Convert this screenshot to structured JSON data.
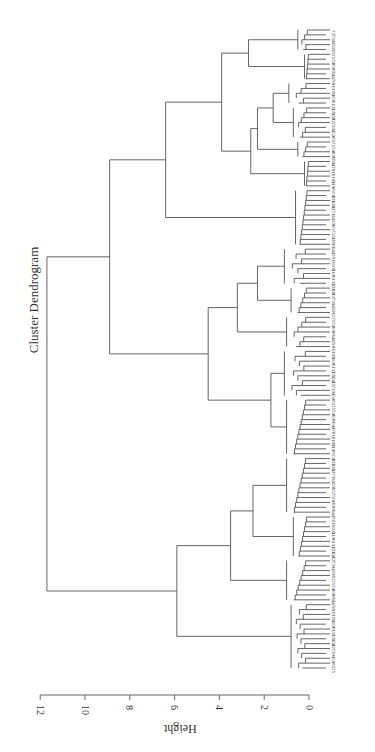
{
  "chart_data": {
    "type": "dendrogram",
    "title": "Cluster Dendrogram",
    "xlabel": "",
    "ylabel": "Height",
    "orientation": "rotated-90 (height axis horizontal, leaves on right)",
    "ylim": [
      0,
      12
    ],
    "ticks": [
      0,
      2,
      4,
      6,
      8,
      10,
      12
    ],
    "line_color": "#555555",
    "tree": {
      "h": 11.7,
      "children": [
        {
          "h": 8.9,
          "children": [
            {
              "h": 6.4,
              "children": [
                {
                  "h": 3.9,
                  "children": [
                    {
                      "h": 2.7,
                      "children": [
                        {
                          "h": 0.5,
                          "leaves": 5
                        },
                        {
                          "h": 0.2,
                          "leaves": 6
                        }
                      ]
                    },
                    {
                      "h": 2.6,
                      "children": [
                        {
                          "h": 2.3,
                          "children": [
                            {
                              "h": 1.6,
                              "children": [
                                {
                                  "h": 0.9,
                                  "leaves": 5
                                },
                                {
                                  "h": 0.7,
                                  "leaves": 7
                                }
                              ]
                            },
                            {
                              "h": 0.5,
                              "leaves": 4
                            }
                          ]
                        },
                        {
                          "h": 0.2,
                          "leaves": 6
                        }
                      ]
                    }
                  ]
                },
                {
                  "h": 0.6,
                  "leaves": 12
                }
              ]
            },
            {
              "h": 4.5,
              "children": [
                {
                  "h": 3.2,
                  "children": [
                    {
                      "h": 2.3,
                      "children": [
                        {
                          "h": 1.1,
                          "leaves": 8
                        },
                        {
                          "h": 0.8,
                          "leaves": 6
                        }
                      ]
                    },
                    {
                      "h": 1.0,
                      "leaves": 7
                    }
                  ]
                },
                {
                  "h": 1.7,
                  "children": [
                    {
                      "h": 1.1,
                      "leaves": 10
                    },
                    {
                      "h": 1.0,
                      "leaves": 12
                    }
                  ]
                }
              ]
            }
          ]
        },
        {
          "h": 5.9,
          "children": [
            {
              "h": 3.5,
              "children": [
                {
                  "h": 2.5,
                  "children": [
                    {
                      "h": 1.0,
                      "leaves": 12
                    },
                    {
                      "h": 0.7,
                      "leaves": 9
                    }
                  ]
                },
                {
                  "h": 1.0,
                  "leaves": 9
                }
              ]
            },
            {
              "h": 0.8,
              "leaves": 14
            }
          ]
        }
      ]
    },
    "visible_leaf_labels_sample": [
      "72",
      "73",
      "94",
      "59",
      "65",
      "75",
      "74",
      "69",
      "66",
      "44",
      "78",
      "16",
      "103",
      "31",
      "96",
      "132",
      "123",
      "134"
    ],
    "leaf_count_approx": 140
  }
}
